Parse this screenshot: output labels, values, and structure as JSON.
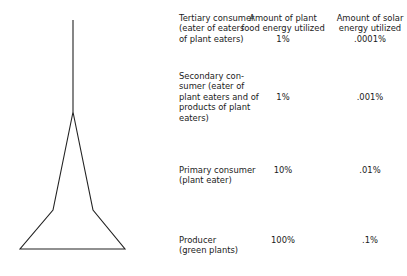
{
  "headers": {
    "plant": "Amount of plant\nfood energy utilized",
    "solar": "Amount of solar\nenergy  utilized"
  },
  "levels": [
    {
      "label": "Tertiary consumer\n(eater of eaters\nof plant eaters)",
      "plant": "1%",
      "solar": ".0001%"
    },
    {
      "label": "Secondary con-\nsumer (eater of\nplant eaters and of\nproducts of plant\neaters)",
      "plant": "1%",
      "solar": ".001%"
    },
    {
      "label": "Primary consumer\n(plant eater)",
      "plant": "10%",
      "solar": ".01%"
    },
    {
      "label": "Producer\n(green plants)",
      "plant": "100%",
      "solar": ".1%"
    }
  ]
}
